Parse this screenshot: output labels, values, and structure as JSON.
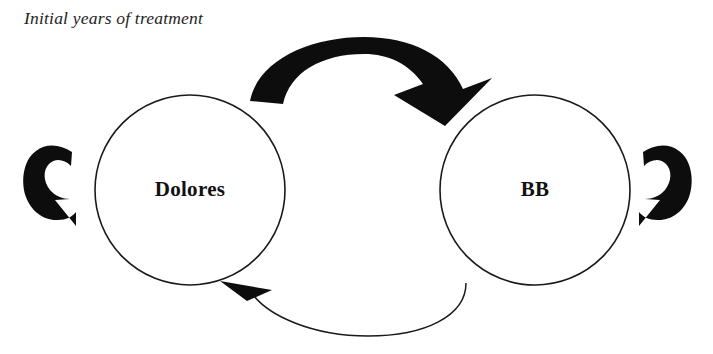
{
  "figure": {
    "caption": "Initial years of treatment",
    "background_color": "#ffffff",
    "ink_color": "#0d0d0d",
    "outline_color": "#1a1a1a"
  },
  "nodes": [
    {
      "id": "dolores",
      "label": "Dolores",
      "shape": "circle",
      "cx": 190,
      "cy": 190,
      "r": 95
    },
    {
      "id": "bb",
      "label": "BB",
      "shape": "circle",
      "cx": 535,
      "cy": 190,
      "r": 95
    }
  ],
  "edges": [
    {
      "id": "dolores-to-bb",
      "from": "dolores",
      "to": "bb",
      "style": "thick-curved-arrow",
      "position": "top",
      "direction": "left-to-right",
      "label": ""
    },
    {
      "id": "bb-to-dolores",
      "from": "bb",
      "to": "dolores",
      "style": "thin-curved-arrow",
      "position": "bottom",
      "direction": "right-to-left",
      "label": ""
    },
    {
      "id": "dolores-self-loop",
      "from": "dolores",
      "to": "dolores",
      "style": "thick-self-loop",
      "position": "left",
      "direction": "clockwise",
      "label": ""
    },
    {
      "id": "bb-self-loop",
      "from": "bb",
      "to": "bb",
      "style": "thick-self-loop",
      "position": "right",
      "direction": "counter-clockwise",
      "label": ""
    }
  ]
}
